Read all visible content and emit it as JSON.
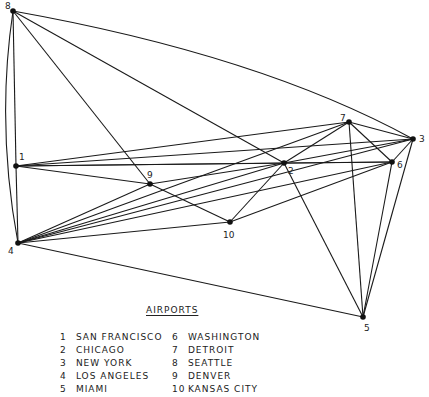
{
  "legend": {
    "title": "AIRPORTS",
    "columns": [
      [
        {
          "num": "1",
          "name": "SAN FRANCISCO"
        },
        {
          "num": "2",
          "name": "CHICAGO"
        },
        {
          "num": "3",
          "name": "NEW YORK"
        },
        {
          "num": "4",
          "name": "LOS ANGELES"
        },
        {
          "num": "5",
          "name": "MIAMI"
        }
      ],
      [
        {
          "num": "6",
          "name": "WASHINGTON"
        },
        {
          "num": "7",
          "name": "DETROIT"
        },
        {
          "num": "8",
          "name": "SEATTLE"
        },
        {
          "num": "9",
          "name": "DENVER"
        },
        {
          "num": "10",
          "name": "KANSAS CITY"
        }
      ]
    ]
  },
  "graph": {
    "nodes": [
      {
        "id": "1",
        "x": 16,
        "y": 166,
        "lx": 19,
        "ly": 160
      },
      {
        "id": "2",
        "x": 284,
        "y": 163,
        "lx": 288,
        "ly": 174
      },
      {
        "id": "3",
        "x": 413,
        "y": 139,
        "lx": 419,
        "ly": 142
      },
      {
        "id": "4",
        "x": 18,
        "y": 243,
        "lx": 8,
        "ly": 254
      },
      {
        "id": "5",
        "x": 363,
        "y": 317,
        "lx": 364,
        "ly": 331
      },
      {
        "id": "6",
        "x": 392,
        "y": 162,
        "lx": 397,
        "ly": 168
      },
      {
        "id": "7",
        "x": 349,
        "y": 122,
        "lx": 340,
        "ly": 121
      },
      {
        "id": "8",
        "x": 13,
        "y": 11,
        "lx": 5,
        "ly": 9
      },
      {
        "id": "9",
        "x": 150,
        "y": 184,
        "lx": 147,
        "ly": 178
      },
      {
        "id": "10",
        "x": 230,
        "y": 222,
        "lx": 223,
        "ly": 238
      }
    ],
    "edges": [
      {
        "from": "8",
        "to": "3",
        "curve": "M13,11 Q260,55 413,139"
      },
      {
        "from": "8",
        "to": "2"
      },
      {
        "from": "8",
        "to": "9"
      },
      {
        "from": "8",
        "to": "1"
      },
      {
        "from": "8",
        "to": "4",
        "curve": "M13,11 Q-4,125 18,243"
      },
      {
        "from": "1",
        "to": "3"
      },
      {
        "from": "1",
        "to": "7"
      },
      {
        "from": "1",
        "to": "6"
      },
      {
        "from": "1",
        "to": "2"
      },
      {
        "from": "1",
        "to": "9"
      },
      {
        "from": "1",
        "to": "4"
      },
      {
        "from": "4",
        "to": "9"
      },
      {
        "from": "4",
        "to": "2"
      },
      {
        "from": "4",
        "to": "3"
      },
      {
        "from": "4",
        "to": "6"
      },
      {
        "from": "4",
        "to": "7"
      },
      {
        "from": "4",
        "to": "10"
      },
      {
        "from": "4",
        "to": "5"
      },
      {
        "from": "9",
        "to": "10"
      },
      {
        "from": "9",
        "to": "2"
      },
      {
        "from": "10",
        "to": "2"
      },
      {
        "from": "10",
        "to": "6"
      },
      {
        "from": "2",
        "to": "7"
      },
      {
        "from": "2",
        "to": "3"
      },
      {
        "from": "2",
        "to": "6"
      },
      {
        "from": "2",
        "to": "5"
      },
      {
        "from": "7",
        "to": "3"
      },
      {
        "from": "7",
        "to": "6"
      },
      {
        "from": "7",
        "to": "5"
      },
      {
        "from": "3",
        "to": "6"
      },
      {
        "from": "3",
        "to": "5"
      },
      {
        "from": "6",
        "to": "5"
      }
    ]
  }
}
